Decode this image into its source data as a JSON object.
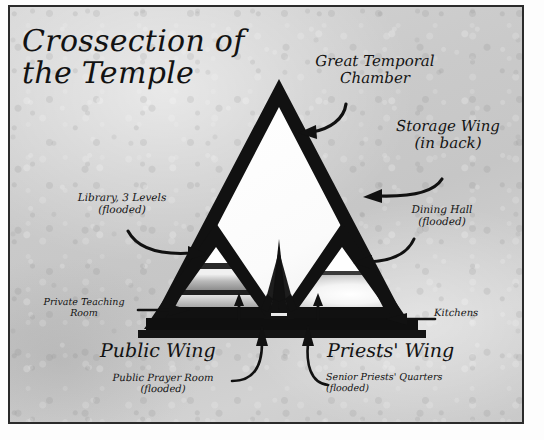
{
  "document": {
    "type": "hand-drawn architectural cross-section illustration",
    "title": "Crossection of\nthe Temple"
  },
  "labels": {
    "great_temporal_chamber": "Great Temporal\nChamber",
    "storage_wing": "Storage Wing\n(in back)",
    "library": "Library, 3 Levels\n(flooded)",
    "dining_hall": "Dining Hall\n(flooded)",
    "private_teaching_room": "Private Teaching\nRoom",
    "kitchens": "Kitchens",
    "public_wing": "Public Wing",
    "priests_wing": "Priests' Wing",
    "public_prayer_room": "Public Prayer Room\n(flooded)",
    "senior_priests_quarters": "Senior Priests' Quarters\n(flooded)"
  },
  "colors": {
    "ink": "#121212",
    "paper_light": "#d5d5d5",
    "paper_dark": "#c6c6c6",
    "chamber_fill": "#ffffff",
    "frame_border": "#2b2b2b",
    "flood_water": "#9b9b9b"
  },
  "diagram": {
    "shape": "large equilateral triangle pyramid cross-section",
    "apex": {
      "x": 277,
      "y": 80
    },
    "base_left": {
      "x": 151,
      "y": 322
    },
    "base_right": {
      "x": 404,
      "y": 322
    },
    "rooms": [
      {
        "name": "great-temporal-chamber",
        "note": "large white open triangular void filling upper pyramid"
      },
      {
        "name": "public-wing-subtriangle",
        "note": "lower-left sub-triangle, 3 stacked flooded library levels"
      },
      {
        "name": "priests-wing-subtriangle",
        "note": "lower-right sub-triangle, glowing flooded dining hall"
      },
      {
        "name": "central-spire",
        "note": "central obelisk monument on the base line"
      }
    ],
    "arrow_count": 10
  }
}
